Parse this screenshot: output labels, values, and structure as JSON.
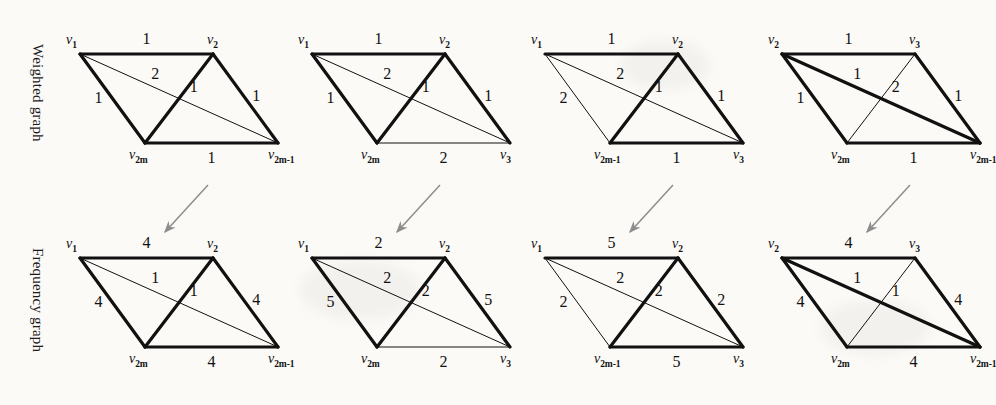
{
  "figure": {
    "row_labels": {
      "weighted": "Weighted graph",
      "frequency": "Frequency graph"
    },
    "layout": {
      "columns": 4,
      "rows": 2,
      "arrow_count": 4,
      "arrow_direction": "down-left"
    },
    "colors": {
      "ink": "#111111",
      "paper": "#fbfaf7",
      "arrow": "#8d8d8d"
    },
    "stroke": {
      "thick": 3.2,
      "thin": 1.0
    }
  },
  "graphs": [
    {
      "id": "weighted-1",
      "row": "weighted",
      "column": 1,
      "vertices": [
        {
          "name": "top-left",
          "label": "v",
          "sub": "1"
        },
        {
          "name": "top-right",
          "label": "v",
          "sub": "2"
        },
        {
          "name": "bottom-left",
          "label": "v",
          "sub": "2m"
        },
        {
          "name": "bottom-right",
          "label": "v",
          "sub": "2m-1"
        }
      ],
      "edges": [
        {
          "name": "top",
          "weight": "1",
          "stroke": "thick"
        },
        {
          "name": "left",
          "weight": "1",
          "stroke": "thick"
        },
        {
          "name": "right",
          "weight": "1",
          "stroke": "thick"
        },
        {
          "name": "bottom",
          "weight": "1",
          "stroke": "thick"
        },
        {
          "name": "short-diagonal",
          "weight": "1",
          "stroke": "thick"
        },
        {
          "name": "long-diagonal",
          "weight": "2",
          "stroke": "thin"
        }
      ]
    },
    {
      "id": "weighted-2",
      "row": "weighted",
      "column": 2,
      "vertices": [
        {
          "name": "top-left",
          "label": "v",
          "sub": "1"
        },
        {
          "name": "top-right",
          "label": "v",
          "sub": "2"
        },
        {
          "name": "bottom-left",
          "label": "v",
          "sub": "2m"
        },
        {
          "name": "bottom-right",
          "label": "v",
          "sub": "3"
        }
      ],
      "edges": [
        {
          "name": "top",
          "weight": "1",
          "stroke": "thick"
        },
        {
          "name": "left",
          "weight": "1",
          "stroke": "thick"
        },
        {
          "name": "right",
          "weight": "1",
          "stroke": "thick"
        },
        {
          "name": "bottom",
          "weight": "2",
          "stroke": "thin"
        },
        {
          "name": "short-diagonal",
          "weight": "1",
          "stroke": "thick"
        },
        {
          "name": "long-diagonal",
          "weight": "2",
          "stroke": "thin"
        }
      ]
    },
    {
      "id": "weighted-3",
      "row": "weighted",
      "column": 3,
      "vertices": [
        {
          "name": "top-left",
          "label": "v",
          "sub": "1"
        },
        {
          "name": "top-right",
          "label": "v",
          "sub": "2"
        },
        {
          "name": "bottom-left",
          "label": "v",
          "sub": "2m-1"
        },
        {
          "name": "bottom-right",
          "label": "v",
          "sub": "3"
        }
      ],
      "edges": [
        {
          "name": "top",
          "weight": "1",
          "stroke": "thick"
        },
        {
          "name": "left",
          "weight": "2",
          "stroke": "thin"
        },
        {
          "name": "right",
          "weight": "1",
          "stroke": "thick"
        },
        {
          "name": "bottom",
          "weight": "1",
          "stroke": "thick"
        },
        {
          "name": "short-diagonal",
          "weight": "1",
          "stroke": "thick"
        },
        {
          "name": "long-diagonal",
          "weight": "2",
          "stroke": "thin"
        }
      ]
    },
    {
      "id": "weighted-4",
      "row": "weighted",
      "column": 4,
      "vertices": [
        {
          "name": "top-left",
          "label": "v",
          "sub": "2"
        },
        {
          "name": "top-right",
          "label": "v",
          "sub": "3"
        },
        {
          "name": "bottom-left",
          "label": "v",
          "sub": "2m"
        },
        {
          "name": "bottom-right",
          "label": "v",
          "sub": "2m-1"
        }
      ],
      "edges": [
        {
          "name": "top",
          "weight": "1",
          "stroke": "thick"
        },
        {
          "name": "left",
          "weight": "1",
          "stroke": "thick"
        },
        {
          "name": "right",
          "weight": "1",
          "stroke": "thick"
        },
        {
          "name": "bottom",
          "weight": "1",
          "stroke": "thick"
        },
        {
          "name": "short-diagonal",
          "weight": "2",
          "stroke": "thin"
        },
        {
          "name": "long-diagonal",
          "weight": "1",
          "stroke": "thick"
        }
      ]
    },
    {
      "id": "frequency-1",
      "row": "frequency",
      "column": 1,
      "vertices": [
        {
          "name": "top-left",
          "label": "v",
          "sub": "1"
        },
        {
          "name": "top-right",
          "label": "v",
          "sub": "2"
        },
        {
          "name": "bottom-left",
          "label": "v",
          "sub": "2m"
        },
        {
          "name": "bottom-right",
          "label": "v",
          "sub": "2m-1"
        }
      ],
      "edges": [
        {
          "name": "top",
          "weight": "4",
          "stroke": "thick"
        },
        {
          "name": "left",
          "weight": "4",
          "stroke": "thick"
        },
        {
          "name": "right",
          "weight": "4",
          "stroke": "thick"
        },
        {
          "name": "bottom",
          "weight": "4",
          "stroke": "thick"
        },
        {
          "name": "short-diagonal",
          "weight": "1",
          "stroke": "thick"
        },
        {
          "name": "long-diagonal",
          "weight": "1",
          "stroke": "thin"
        }
      ]
    },
    {
      "id": "frequency-2",
      "row": "frequency",
      "column": 2,
      "vertices": [
        {
          "name": "top-left",
          "label": "v",
          "sub": "1"
        },
        {
          "name": "top-right",
          "label": "v",
          "sub": "2"
        },
        {
          "name": "bottom-left",
          "label": "v",
          "sub": "2m"
        },
        {
          "name": "bottom-right",
          "label": "v",
          "sub": "3"
        }
      ],
      "edges": [
        {
          "name": "top",
          "weight": "2",
          "stroke": "thick"
        },
        {
          "name": "left",
          "weight": "5",
          "stroke": "thick"
        },
        {
          "name": "right",
          "weight": "5",
          "stroke": "thick"
        },
        {
          "name": "bottom",
          "weight": "2",
          "stroke": "thin"
        },
        {
          "name": "short-diagonal",
          "weight": "2",
          "stroke": "thick"
        },
        {
          "name": "long-diagonal",
          "weight": "2",
          "stroke": "thin"
        }
      ]
    },
    {
      "id": "frequency-3",
      "row": "frequency",
      "column": 3,
      "vertices": [
        {
          "name": "top-left",
          "label": "v",
          "sub": "1"
        },
        {
          "name": "top-right",
          "label": "v",
          "sub": "2"
        },
        {
          "name": "bottom-left",
          "label": "v",
          "sub": "2m-1"
        },
        {
          "name": "bottom-right",
          "label": "v",
          "sub": "3"
        }
      ],
      "edges": [
        {
          "name": "top",
          "weight": "5",
          "stroke": "thick"
        },
        {
          "name": "left",
          "weight": "2",
          "stroke": "thin"
        },
        {
          "name": "right",
          "weight": "2",
          "stroke": "thick"
        },
        {
          "name": "bottom",
          "weight": "5",
          "stroke": "thick"
        },
        {
          "name": "short-diagonal",
          "weight": "2",
          "stroke": "thick"
        },
        {
          "name": "long-diagonal",
          "weight": "2",
          "stroke": "thin"
        }
      ]
    },
    {
      "id": "frequency-4",
      "row": "frequency",
      "column": 4,
      "vertices": [
        {
          "name": "top-left",
          "label": "v",
          "sub": "2"
        },
        {
          "name": "top-right",
          "label": "v",
          "sub": "3"
        },
        {
          "name": "bottom-left",
          "label": "v",
          "sub": "2m"
        },
        {
          "name": "bottom-right",
          "label": "v",
          "sub": "2m-1"
        }
      ],
      "edges": [
        {
          "name": "top",
          "weight": "4",
          "stroke": "thick"
        },
        {
          "name": "left",
          "weight": "4",
          "stroke": "thick"
        },
        {
          "name": "right",
          "weight": "4",
          "stroke": "thick"
        },
        {
          "name": "bottom",
          "weight": "4",
          "stroke": "thick"
        },
        {
          "name": "short-diagonal",
          "weight": "1",
          "stroke": "thin"
        },
        {
          "name": "long-diagonal",
          "weight": "1",
          "stroke": "thick"
        }
      ]
    }
  ]
}
